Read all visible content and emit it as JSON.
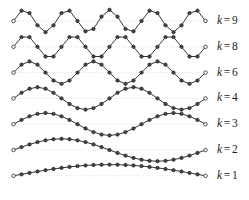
{
  "figure": {
    "background_color": "#ffffff",
    "line_color": "#2b2b2b",
    "marker_fill_color": "#4a4a4a",
    "marker_edge_color": "#1b1b1b",
    "endpoint_fill_color": "#ffffff",
    "baseline_color": "#b9b9b9",
    "label_color": "#1b1b1b"
  },
  "labels": {
    "variable": "k",
    "equals": "=",
    "rows": [
      "9",
      "8",
      "6",
      "4",
      "3",
      "2",
      "1"
    ]
  },
  "chart_data": {
    "type": "line",
    "xlabel": "",
    "ylabel": "",
    "grid": false,
    "legend_position": "right",
    "n_samples": 25,
    "x": [
      0,
      1,
      2,
      3,
      4,
      5,
      6,
      7,
      8,
      9,
      10,
      11,
      12,
      13,
      14,
      15,
      16,
      17,
      18,
      19,
      20,
      21,
      22,
      23,
      24
    ],
    "ylim": [
      -1,
      1
    ],
    "series": [
      {
        "name": "k = 9",
        "k": 9,
        "values": [
          0.0,
          0.924,
          0.707,
          -0.383,
          -1.0,
          -0.383,
          0.707,
          0.924,
          0.0,
          -0.924,
          -0.707,
          0.383,
          1.0,
          0.383,
          -0.707,
          -0.924,
          0.0,
          0.924,
          0.707,
          -0.383,
          -1.0,
          -0.383,
          0.707,
          0.924,
          0.0
        ]
      },
      {
        "name": "k = 8",
        "k": 8,
        "values": [
          0.0,
          0.866,
          0.866,
          0.0,
          -0.866,
          -0.866,
          0.0,
          0.866,
          0.866,
          0.0,
          -0.866,
          -0.866,
          0.0,
          0.866,
          0.866,
          0.0,
          -0.866,
          -0.866,
          0.0,
          0.866,
          0.866,
          0.0,
          -0.866,
          -0.866,
          0.0
        ]
      },
      {
        "name": "k = 6",
        "k": 6,
        "values": [
          0.0,
          0.707,
          1.0,
          0.707,
          0.0,
          -0.707,
          -1.0,
          -0.707,
          0.0,
          0.707,
          1.0,
          0.707,
          0.0,
          -0.707,
          -1.0,
          -0.707,
          0.0,
          0.707,
          1.0,
          0.707,
          0.0,
          -0.707,
          -1.0,
          -0.707,
          0.0
        ]
      },
      {
        "name": "k = 4",
        "k": 4,
        "values": [
          0.0,
          0.5,
          0.866,
          1.0,
          0.866,
          0.5,
          0.0,
          -0.5,
          -0.866,
          -1.0,
          -0.866,
          -0.5,
          0.0,
          0.5,
          0.866,
          1.0,
          0.866,
          0.5,
          0.0,
          -0.5,
          -0.866,
          -1.0,
          -0.866,
          -0.5,
          0.0
        ]
      },
      {
        "name": "k = 3",
        "k": 3,
        "values": [
          0.0,
          0.383,
          0.707,
          0.924,
          1.0,
          0.924,
          0.707,
          0.383,
          0.0,
          -0.383,
          -0.707,
          -0.924,
          -1.0,
          -0.924,
          -0.707,
          -0.383,
          0.0,
          0.383,
          0.707,
          0.924,
          1.0,
          0.924,
          0.707,
          0.383,
          0.0
        ]
      },
      {
        "name": "k = 2",
        "k": 2,
        "values": [
          0.0,
          0.259,
          0.5,
          0.707,
          0.866,
          0.966,
          1.0,
          0.966,
          0.866,
          0.707,
          0.5,
          0.259,
          0.0,
          -0.259,
          -0.5,
          -0.707,
          -0.866,
          -0.966,
          -1.0,
          -0.966,
          -0.866,
          -0.707,
          -0.5,
          -0.259,
          0.0
        ]
      },
      {
        "name": "k = 1",
        "k": 1,
        "values": [
          0.0,
          0.131,
          0.259,
          0.383,
          0.5,
          0.609,
          0.707,
          0.793,
          0.866,
          0.924,
          0.966,
          0.991,
          1.0,
          0.991,
          0.966,
          0.924,
          0.866,
          0.793,
          0.707,
          0.609,
          0.5,
          0.383,
          0.259,
          0.131,
          0.0
        ]
      }
    ]
  }
}
